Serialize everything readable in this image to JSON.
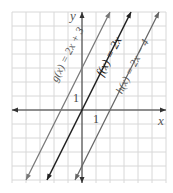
{
  "chart_data": {
    "type": "line",
    "title": "",
    "xlabel": "x",
    "ylabel": "y",
    "xlim": [
      -5,
      6
    ],
    "ylim": [
      -5,
      7
    ],
    "grid": true,
    "tick_labels": {
      "x": "1",
      "y": "1"
    },
    "series": [
      {
        "name": "g(x) = 2x + 3",
        "slope": 2,
        "intercept": 3,
        "color": "#777777",
        "x": [
          -4,
          2
        ],
        "y": [
          -5,
          7
        ]
      },
      {
        "name": "f(x) = 2x",
        "slope": 2,
        "intercept": 0,
        "color": "#222222",
        "x": [
          -2.5,
          3.5
        ],
        "y": [
          -5,
          7
        ]
      },
      {
        "name": "h(x) = 2x − 4",
        "slope": 2,
        "intercept": -4,
        "color": "#666666",
        "x": [
          -0.5,
          5.5
        ],
        "y": [
          -5,
          7
        ]
      }
    ]
  },
  "labels": {
    "y_axis": "y",
    "x_axis": "x",
    "one_x": "1",
    "one_y": "1",
    "g": "g(x) = 2x + 3",
    "f": "f(x) = 2x",
    "h": "h(x) = 2x − 4"
  }
}
